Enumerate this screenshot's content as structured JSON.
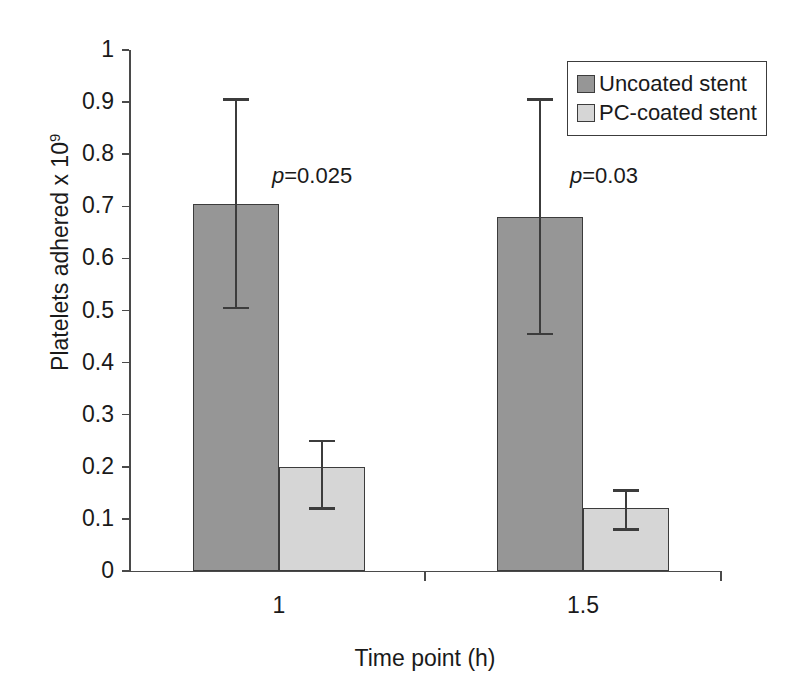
{
  "chart_data": {
    "type": "bar",
    "title": "",
    "xlabel": "Time point (h)",
    "ylabel": "Platelets adhered x 10",
    "ylabel_exponent": "9",
    "categories": [
      "1",
      "1.5"
    ],
    "ylim": [
      0,
      1
    ],
    "ytick_labels": [
      "0",
      "0.1",
      "0.2",
      "0.3",
      "0.4",
      "0.5",
      "0.6",
      "0.7",
      "0.8",
      "0.9",
      "1"
    ],
    "ytick_values": [
      0,
      0.1,
      0.2,
      0.3,
      0.4,
      0.5,
      0.6,
      0.7,
      0.8,
      0.9,
      1
    ],
    "grid": false,
    "legend_position": "top-right",
    "series": [
      {
        "name": "Uncoated stent",
        "color": "#969696",
        "values": [
          0.705,
          0.68
        ],
        "error_upper": [
          0.905,
          0.905
        ],
        "error_lower": [
          0.505,
          0.455
        ]
      },
      {
        "name": "PC-coated stent",
        "color": "#d6d6d6",
        "values": [
          0.2,
          0.12
        ],
        "error_upper": [
          0.25,
          0.155
        ],
        "error_lower": [
          0.12,
          0.08
        ]
      }
    ],
    "annotations": [
      {
        "text_prefix": "p",
        "text_suffix": "=0.025",
        "category": "1"
      },
      {
        "text_prefix": "p",
        "text_suffix": "=0.03",
        "category": "1.5"
      }
    ]
  },
  "legend": {
    "items": [
      {
        "label": "Uncoated stent",
        "color": "#969696"
      },
      {
        "label": "PC-coated stent",
        "color": "#d6d6d6"
      }
    ]
  },
  "axes": {
    "x_title": "Time point (h)",
    "y_title_main": "Platelets adhered x 10",
    "y_title_sup": "9"
  }
}
